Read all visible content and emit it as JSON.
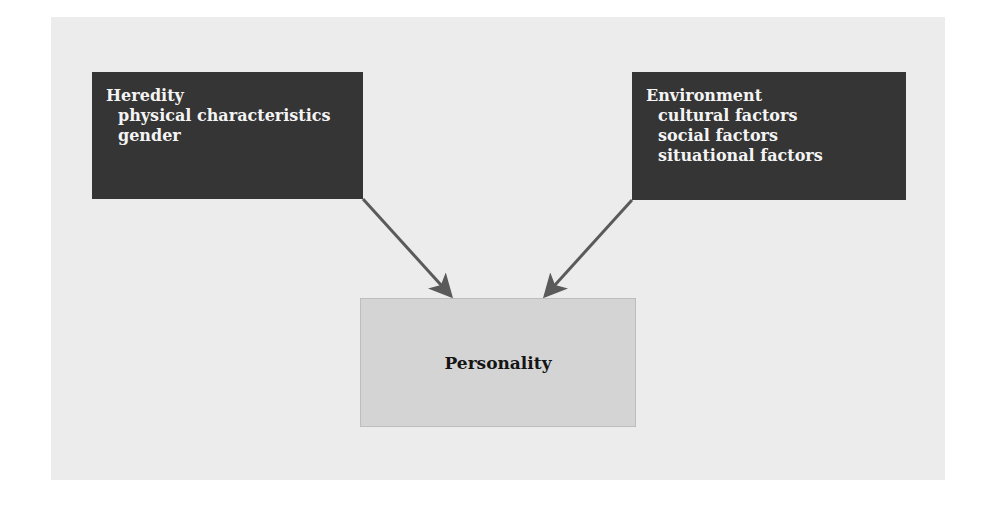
{
  "diagram": {
    "nodes": {
      "heredity": {
        "title": "Heredity",
        "items": [
          "physical characteristics",
          "gender"
        ]
      },
      "environment": {
        "title": "Environment",
        "items": [
          "cultural factors",
          "social factors",
          "situational factors"
        ]
      },
      "personality": {
        "title": "Personality"
      }
    },
    "edges": [
      {
        "from": "Heredity",
        "to": "Personality"
      },
      {
        "from": "Environment",
        "to": "Personality"
      }
    ],
    "colors": {
      "panel_background": "#ececec",
      "source_box": "#353535",
      "source_text": "#f4f4f4",
      "target_box": "#d4d4d4",
      "arrow": "#5a5a5a"
    }
  }
}
